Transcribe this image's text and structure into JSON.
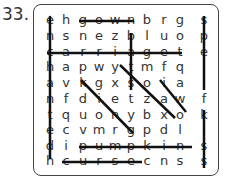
{
  "puzzle": {
    "number": "33.",
    "grid": [
      [
        "e",
        "h",
        "g",
        "o",
        "w",
        "n",
        "b",
        "r",
        "g",
        "s"
      ],
      [
        "n",
        "s",
        "n",
        "e",
        "z",
        "b",
        "l",
        "u",
        "o",
        "p"
      ],
      [
        "c",
        "a",
        "r",
        "r",
        "i",
        "a",
        "g",
        "e",
        "t",
        "e"
      ],
      [
        "h",
        "a",
        "p",
        "w",
        "y",
        "t",
        "m",
        "f",
        "q",
        "l"
      ],
      [
        "a",
        "v",
        "k",
        "g",
        "x",
        "s",
        "o",
        "i",
        "a",
        "l"
      ],
      [
        "n",
        "f",
        "d",
        "i",
        "e",
        "t",
        "z",
        "a",
        "w",
        "f"
      ],
      [
        "t",
        "q",
        "u",
        "o",
        "n",
        "y",
        "b",
        "x",
        "o",
        "k"
      ],
      [
        "e",
        "c",
        "v",
        "m",
        "r",
        "g",
        "p",
        "d",
        "l",
        "i"
      ],
      [
        "d",
        "i",
        "p",
        "u",
        "m",
        "p",
        "k",
        "i",
        "n",
        "s"
      ],
      [
        "h",
        "c",
        "u",
        "r",
        "s",
        "e",
        "c",
        "n",
        "s",
        "s"
      ]
    ],
    "found_words": [
      "enchanted",
      "gown",
      "carriage",
      "spell",
      "bats",
      "pumpkin",
      "curse"
    ],
    "line_color": "#111111"
  }
}
